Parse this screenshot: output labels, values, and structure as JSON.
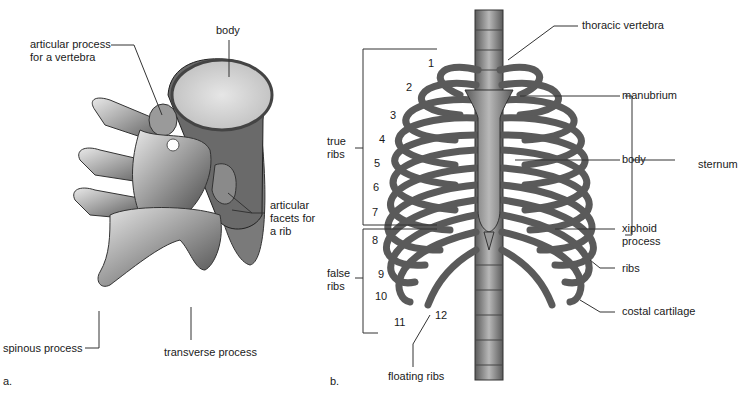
{
  "panel_a": {
    "letter": "a.",
    "labels": {
      "articular_process": "articular process\nfor a vertebra",
      "body": "body",
      "articular_facets": "articular\nfacets for\na rib",
      "spinous_process": "spinous process",
      "transverse_process": "transverse process"
    }
  },
  "panel_b": {
    "letter": "b.",
    "labels": {
      "thoracic_vertebra": "thoracic vertebra",
      "manubrium": "manubrium",
      "body": "body",
      "sternum": "sternum",
      "xiphoid_process": "xiphoid\nprocess",
      "ribs": "ribs",
      "costal_cartilage": "costal cartilage",
      "true_ribs": "true\nribs",
      "false_ribs": "false\nribs",
      "floating_ribs": "floating ribs"
    },
    "rib_numbers": [
      "1",
      "2",
      "3",
      "4",
      "5",
      "6",
      "7",
      "8",
      "9",
      "10",
      "11",
      "12"
    ]
  },
  "colors": {
    "bone_light": "#d9d9d9",
    "bone_mid": "#8c8c8c",
    "bone_dark": "#3a3a3a",
    "leader_line": "#333333",
    "background": "#ffffff"
  }
}
